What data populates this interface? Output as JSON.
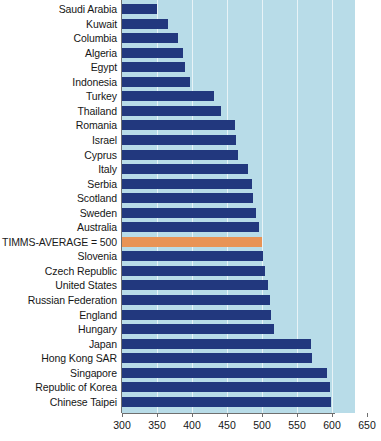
{
  "chart_data": {
    "type": "bar",
    "orientation": "horizontal",
    "title": "",
    "subtitle": "",
    "xlabel": "",
    "ylabel": "",
    "xlim": [
      300,
      650
    ],
    "xticks": [
      300,
      350,
      400,
      450,
      500,
      550,
      600,
      650
    ],
    "xtick_labels": [
      "300",
      "350",
      "400",
      "450",
      "500",
      "550",
      "600",
      "650"
    ],
    "grid": true,
    "grid_axis": "x",
    "legend": "none",
    "plot_background": "#b8dce8",
    "bar_color": "#22387e",
    "highlight_color": "#e89355",
    "gridline_color": "#e8f3f7",
    "axis_color": "#6f6f6f",
    "highlight_category": "TIMMS-AVERAGE = 500",
    "categories": [
      "Saudi Arabia",
      "Kuwait",
      "Columbia",
      "Algeria",
      "Egypt",
      "Indonesia",
      "Turkey",
      "Thailand",
      "Romania",
      "Israel",
      "Cyprus",
      "Italy",
      "Serbia",
      "Scotland",
      "Sweden",
      "Australia",
      "TIMMS-AVERAGE = 500",
      "Slovenia",
      "Czech Republic",
      "United States",
      "Russian Federation",
      "England",
      "Hungary",
      "Japan",
      "Hong Kong SAR",
      "Singapore",
      "Republic of Korea",
      "Chinese Taipei"
    ],
    "values": [
      350,
      365,
      380,
      387,
      390,
      397,
      432,
      441,
      461,
      463,
      465,
      480,
      486,
      487,
      491,
      496,
      500,
      501,
      504,
      508,
      512,
      513,
      517,
      570,
      572,
      593,
      597,
      598
    ]
  }
}
